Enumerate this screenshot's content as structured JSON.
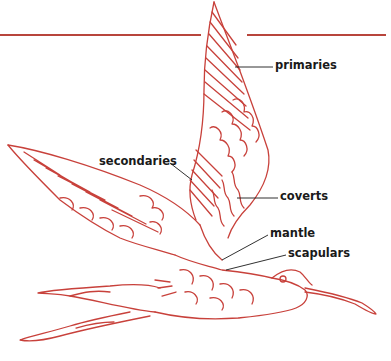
{
  "diagram": {
    "colors": {
      "drawing": "#c8413b",
      "rule": "#b8453c",
      "label_text": "#1a1a1a",
      "leader": "#1a1a1a",
      "background": "#ffffff"
    },
    "labels": [
      {
        "id": "primaries",
        "text": "primaries",
        "x": 275,
        "y": 60,
        "leader": [
          [
            235,
            67
          ],
          [
            273,
            67
          ]
        ]
      },
      {
        "id": "secondaries",
        "text": "secondaries",
        "x": 99,
        "y": 156,
        "leader": [
          [
            170,
            163
          ],
          [
            192,
            180
          ]
        ]
      },
      {
        "id": "coverts",
        "text": "coverts",
        "x": 280,
        "y": 191,
        "leader": [
          [
            237,
            198
          ],
          [
            278,
            198
          ]
        ]
      },
      {
        "id": "mantle",
        "text": "mantle",
        "x": 270,
        "y": 228,
        "leader": [
          [
            222,
            260
          ],
          [
            268,
            235
          ]
        ]
      },
      {
        "id": "scapulars",
        "text": "scapulars",
        "x": 288,
        "y": 248,
        "leader": [
          [
            226,
            270
          ],
          [
            286,
            255
          ]
        ]
      }
    ]
  }
}
